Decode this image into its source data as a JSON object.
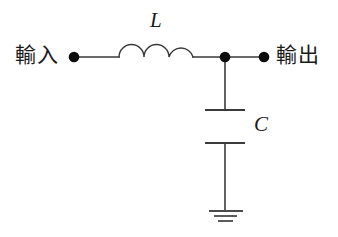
{
  "diagram": {
    "background_color": "#ffffff",
    "line_color": "#3a3a3a",
    "node_color": "#0d0d0d",
    "labels": {
      "input": "輸入",
      "output": "輸出",
      "inductor": "L",
      "capacitor": "C"
    },
    "components": [
      {
        "name": "inductor",
        "symbol_label": "L",
        "symbol": "three-arc-coil",
        "orientation": "horizontal"
      },
      {
        "name": "capacitor",
        "symbol_label": "C",
        "symbol": "two-parallel-plates",
        "orientation": "vertical"
      },
      {
        "name": "ground",
        "symbol_label": "",
        "symbol": "three-bar-ground",
        "orientation": "vertical"
      }
    ],
    "terminals": [
      {
        "name": "input-terminal",
        "label": "輸入"
      },
      {
        "name": "junction-node",
        "label": ""
      },
      {
        "name": "output-terminal",
        "label": "輸出"
      }
    ]
  }
}
